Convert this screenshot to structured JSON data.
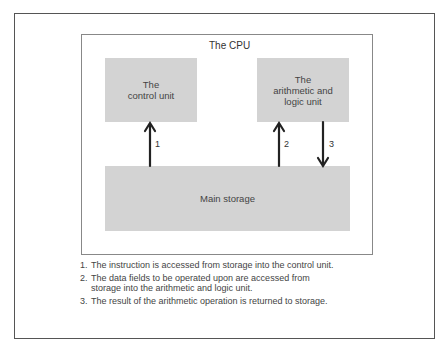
{
  "diagram": {
    "cpu_label": "The CPU",
    "control_unit": "The\ncontrol unit",
    "alu": "The\narithmetic and\nlogic unit",
    "main_storage": "Main storage",
    "arrows": [
      {
        "label": "1",
        "direction": "up",
        "from": "Main storage",
        "to": "The control unit"
      },
      {
        "label": "2",
        "direction": "up",
        "from": "Main storage",
        "to": "The arithmetic and logic unit"
      },
      {
        "label": "3",
        "direction": "down",
        "from": "The arithmetic and logic unit",
        "to": "Main storage"
      }
    ],
    "colors": {
      "box_fill": "#d3d3d3",
      "border": "#555555",
      "arrow": "#222222"
    }
  },
  "notes": [
    {
      "num": "1.",
      "text": "The instruction is accessed from storage into the control unit."
    },
    {
      "num": "2.",
      "text": "The data fields to be operated upon are accessed from storage into the arithmetic and logic unit."
    },
    {
      "num": "3.",
      "text": "The result of the arithmetic operation is returned to storage."
    }
  ]
}
